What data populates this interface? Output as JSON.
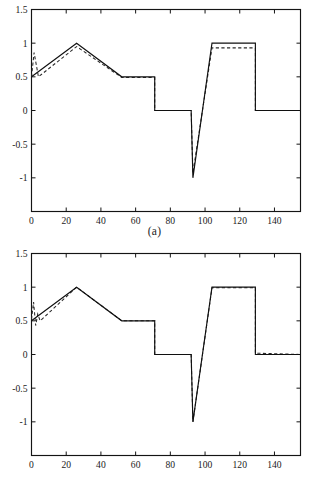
{
  "figure": {
    "panels": [
      {
        "id": "a",
        "caption": "(a)"
      },
      {
        "id": "b",
        "caption": "(b)"
      }
    ]
  },
  "chart_data": [
    {
      "type": "line",
      "panel": "a",
      "title": "",
      "xlabel": "",
      "ylabel": "",
      "xlim": [
        0,
        155
      ],
      "ylim": [
        -1.5,
        1.5
      ],
      "xticks": [
        0,
        20,
        40,
        60,
        80,
        100,
        120,
        140
      ],
      "xticklabels": [
        "0",
        "20",
        "40",
        "60",
        "80",
        "100",
        "120",
        "140"
      ],
      "yticks": [
        -1,
        -0.5,
        0,
        0.5,
        1,
        1.5
      ],
      "yticklabels": [
        "-1",
        "-0.5",
        "0",
        "0.5",
        "1",
        "1.5"
      ],
      "grid": false,
      "legend": null,
      "series": [
        {
          "name": "original",
          "style": "solid",
          "color": "#101010",
          "points": [
            [
              0,
              0.5
            ],
            [
              26,
              1.0
            ],
            [
              52,
              0.5
            ],
            [
              71,
              0.5
            ],
            [
              71,
              0.0
            ],
            [
              92,
              0.0
            ],
            [
              93,
              -1.0
            ],
            [
              104,
              1.0
            ],
            [
              129,
              1.0
            ],
            [
              129,
              0.0
            ],
            [
              155,
              0.0
            ]
          ]
        },
        {
          "name": "reconstruction",
          "style": "dashed",
          "color": "#2a2a2a",
          "points": [
            [
              0,
              0.5
            ],
            [
              1.5,
              0.86
            ],
            [
              4,
              0.5
            ],
            [
              26,
              0.95
            ],
            [
              52,
              0.49
            ],
            [
              71,
              0.49
            ],
            [
              71,
              0.0
            ],
            [
              92,
              0.0
            ],
            [
              93,
              -0.93
            ],
            [
              104,
              0.93
            ],
            [
              129,
              0.93
            ],
            [
              129,
              0.0
            ],
            [
              155,
              0.0
            ]
          ]
        }
      ]
    },
    {
      "type": "line",
      "panel": "b",
      "title": "",
      "xlabel": "",
      "ylabel": "",
      "xlim": [
        0,
        155
      ],
      "ylim": [
        -1.5,
        1.5
      ],
      "xticks": [
        0,
        20,
        40,
        60,
        80,
        100,
        120,
        140
      ],
      "xticklabels": [
        "0",
        "20",
        "40",
        "60",
        "80",
        "100",
        "120",
        "140"
      ],
      "yticks": [
        -1,
        -0.5,
        0,
        0.5,
        1,
        1.5
      ],
      "yticklabels": [
        "-1",
        "-0.5",
        "0",
        "0.5",
        "1",
        "1.5"
      ],
      "grid": false,
      "legend": null,
      "series": [
        {
          "name": "original",
          "style": "solid",
          "color": "#101010",
          "points": [
            [
              0,
              0.5
            ],
            [
              26,
              1.0
            ],
            [
              52,
              0.5
            ],
            [
              71,
              0.5
            ],
            [
              71,
              0.0
            ],
            [
              92,
              0.0
            ],
            [
              93,
              -1.0
            ],
            [
              104,
              1.0
            ],
            [
              129,
              1.0
            ],
            [
              129,
              0.0
            ],
            [
              155,
              0.0
            ]
          ]
        },
        {
          "name": "reconstruction",
          "style": "dashed",
          "color": "#2a2a2a",
          "points": [
            [
              0,
              0.52
            ],
            [
              1.2,
              0.78
            ],
            [
              2.4,
              0.43
            ],
            [
              3.6,
              0.6
            ],
            [
              5,
              0.5
            ],
            [
              26,
              1.0
            ],
            [
              52,
              0.5
            ],
            [
              71,
              0.5
            ],
            [
              71,
              0.0
            ],
            [
              92,
              0.0
            ],
            [
              93,
              -1.0
            ],
            [
              104,
              0.99
            ],
            [
              129,
              0.99
            ],
            [
              129,
              0.02
            ],
            [
              155,
              0.0
            ]
          ]
        }
      ]
    }
  ]
}
